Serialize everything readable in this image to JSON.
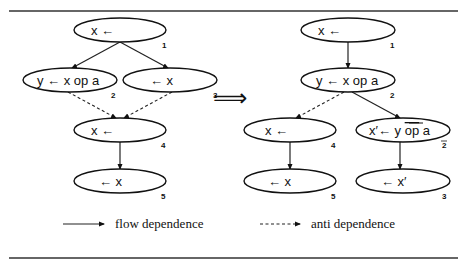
{
  "figure": {
    "implies_symbol": "⟹",
    "left_graph": {
      "nodes": [
        {
          "id": "1",
          "label": "x ←",
          "cx": 120,
          "cy": 30
        },
        {
          "id": "2",
          "label": "y ←  x op a",
          "cx": 70,
          "cy": 80
        },
        {
          "id": "3",
          "label": "←  x",
          "cx": 170,
          "cy": 80
        },
        {
          "id": "4",
          "label": "x ←",
          "cx": 120,
          "cy": 130
        },
        {
          "id": "5",
          "label": "←  x",
          "cx": 120,
          "cy": 181
        }
      ],
      "edges": [
        {
          "from": "1",
          "to": "2",
          "type": "flow"
        },
        {
          "from": "1",
          "to": "3",
          "type": "flow"
        },
        {
          "from": "2",
          "to": "4",
          "type": "anti"
        },
        {
          "from": "3",
          "to": "4",
          "type": "anti"
        },
        {
          "from": "4",
          "to": "5",
          "type": "flow"
        }
      ]
    },
    "right_graph": {
      "nodes": [
        {
          "id": "1",
          "label": "x ←",
          "cx": 348,
          "cy": 30
        },
        {
          "id": "2",
          "label": "y ←  x op a",
          "cx": 348,
          "cy": 80
        },
        {
          "id": "4",
          "label": "x ←",
          "cx": 290,
          "cy": 130
        },
        {
          "id": "2̄",
          "label_prefix": "x′←  y  ",
          "label_op": "op",
          "label_suffix": " a",
          "cx": 403,
          "cy": 130
        },
        {
          "id": "5",
          "label": "←  x",
          "cx": 290,
          "cy": 181
        },
        {
          "id": "3",
          "label": "←  x′",
          "cx": 403,
          "cy": 181
        }
      ],
      "edges": [
        {
          "from": "1",
          "to": "2",
          "type": "flow"
        },
        {
          "from": "2",
          "to": "4",
          "type": "anti"
        },
        {
          "from": "2",
          "to": "2̄",
          "type": "flow"
        },
        {
          "from": "4",
          "to": "5",
          "type": "flow"
        },
        {
          "from": "2̄",
          "to": "3",
          "type": "flow"
        }
      ]
    },
    "legend": {
      "flow_label": "flow dependence",
      "anti_label": "anti dependence"
    }
  }
}
